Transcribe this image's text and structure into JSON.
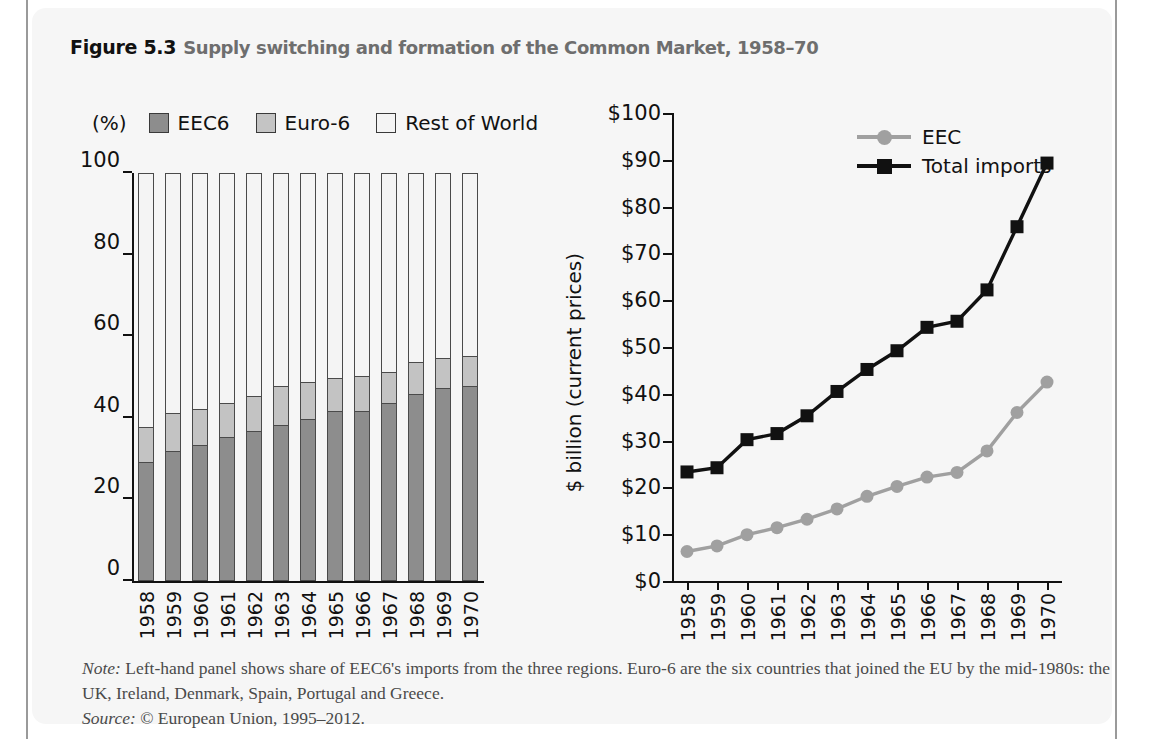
{
  "figure": {
    "number": "Figure 5.3",
    "caption": "Supply switching and formation of the Common Market, 1958–70"
  },
  "notes": {
    "note_label": "Note:",
    "note_text": " Left-hand panel shows share of EEC6's imports from the three regions. Euro-6 are the six countries that joined the EU by the mid-1980s: the UK, Ireland, Denmark, Spain, Portugal and Greece.",
    "source_label": "Source:",
    "source_text": " © European Union, 1995–2012."
  },
  "colors": {
    "eec6": "#8d8d8d",
    "euro6": "#c3c3c3",
    "rest_of_world": "#f4f4f4",
    "eec_line": "#a0a0a0",
    "total_imports_line": "#111111",
    "axis": "#111111",
    "panel_background": "#f6f6f6"
  },
  "background_text": [
    "The low exports fall.",
    "The farmer exports fall.",
    "Total home imports",
    "rest price and quantity data is than been similarly",
    "the imports here the supplier who the water pub",
    "takes over it and the the purser lies the equivalent",
    "it means the fact that farmer is aid to the as",
    "moved resources from the two sources then that",
    "on the total surplus the reel of that the loss",
    "1.2 a price must be point and the self",
    "Note that gainers net income and the production",
    "mostly in the realisation to EC trade of the",
    "use that is the reason that rather than a common",
    "1.3 Welfare effects",
    "the now consider briefly to",
    "the considered terms into show",
    "this section and the world conditions the end of",
    "as in Chapter 4, all welfare effects",
    "totally involve box effects"
  ],
  "chart_data": [
    {
      "type": "bar",
      "stacked": true,
      "panel": "left",
      "title": "",
      "axis_unit_label": "(%)",
      "xlabel": "",
      "ylabel": "",
      "ylim": [
        0,
        100
      ],
      "yticks": [
        0,
        20,
        40,
        60,
        80,
        100
      ],
      "grid": false,
      "legend_position": "top",
      "categories": [
        "1958",
        "1959",
        "1960",
        "1961",
        "1962",
        "1963",
        "1964",
        "1965",
        "1966",
        "1967",
        "1968",
        "1969",
        "1970"
      ],
      "series": [
        {
          "name": "EEC6",
          "color": "#8d8d8d",
          "values": [
            29.0,
            31.5,
            33.0,
            35.0,
            36.5,
            38.0,
            39.5,
            41.5,
            41.5,
            43.5,
            45.5,
            47.0,
            47.5
          ]
        },
        {
          "name": "Euro-6",
          "color": "#c3c3c3",
          "values": [
            8.5,
            9.5,
            9.0,
            8.5,
            8.5,
            9.5,
            9.0,
            8.0,
            8.5,
            7.5,
            8.0,
            7.5,
            7.5
          ]
        },
        {
          "name": "Rest of World",
          "color": "#f4f4f4",
          "values": [
            62.5,
            59.0,
            58.0,
            56.5,
            55.0,
            52.5,
            51.5,
            50.5,
            50.0,
            49.0,
            46.5,
            45.5,
            45.0
          ]
        }
      ],
      "cumulative_tops": {
        "eec6": [
          29.0,
          31.5,
          33.0,
          35.0,
          36.5,
          38.0,
          39.5,
          41.5,
          41.5,
          43.5,
          45.5,
          47.0,
          47.5
        ],
        "euro6": [
          37.5,
          41.0,
          42.0,
          43.5,
          45.0,
          47.5,
          48.5,
          49.5,
          50.0,
          51.0,
          53.5,
          54.5,
          55.0
        ]
      }
    },
    {
      "type": "line",
      "panel": "right",
      "title": "",
      "xlabel": "",
      "ylabel": "$ billion (current prices)",
      "ylim": [
        0,
        100
      ],
      "yticks": [
        0,
        10,
        20,
        30,
        40,
        50,
        60,
        70,
        80,
        90,
        100
      ],
      "ytick_labels": [
        "$0",
        "$10",
        "$20",
        "$30",
        "$40",
        "$50",
        "$60",
        "$70",
        "$80",
        "$90",
        "$100"
      ],
      "grid": false,
      "legend_position": "top-left-inside",
      "x": [
        "1958",
        "1959",
        "1960",
        "1961",
        "1962",
        "1963",
        "1964",
        "1965",
        "1966",
        "1967",
        "1968",
        "1969",
        "1970"
      ],
      "series": [
        {
          "name": "EEC",
          "color": "#a0a0a0",
          "marker": "circle",
          "values": [
            6.3,
            7.5,
            9.9,
            11.4,
            13.2,
            15.4,
            18.1,
            20.2,
            22.2,
            23.2,
            27.8,
            36.0,
            42.5
          ]
        },
        {
          "name": "Total imports",
          "color": "#111111",
          "marker": "square",
          "values": [
            23.3,
            24.2,
            30.2,
            31.5,
            35.3,
            40.5,
            45.2,
            49.2,
            54.2,
            55.5,
            62.2,
            75.7,
            89.3
          ]
        }
      ]
    }
  ]
}
